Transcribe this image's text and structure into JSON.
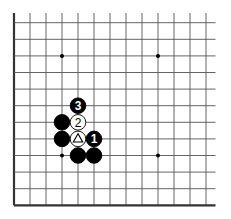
{
  "diagram": {
    "type": "go-board-fragment",
    "columns": 13,
    "rows": 12,
    "edges": {
      "left": true,
      "bottom": true,
      "top": false,
      "right": false
    },
    "hoshi": [
      [
        3,
        2
      ],
      [
        9,
        2
      ],
      [
        3,
        8
      ],
      [
        9,
        8
      ]
    ],
    "stones": [
      {
        "col": 4,
        "row": 5,
        "color": "black",
        "label": "3"
      },
      {
        "col": 3,
        "row": 6,
        "color": "black",
        "label": ""
      },
      {
        "col": 4,
        "row": 6,
        "color": "white",
        "label": "2"
      },
      {
        "col": 3,
        "row": 7,
        "color": "black",
        "label": ""
      },
      {
        "col": 4,
        "row": 7,
        "color": "white",
        "label": "",
        "marker": "triangle"
      },
      {
        "col": 5,
        "row": 7,
        "color": "black",
        "label": "1"
      },
      {
        "col": 4,
        "row": 8,
        "color": "black",
        "label": ""
      },
      {
        "col": 5,
        "row": 8,
        "color": "black",
        "label": ""
      }
    ],
    "colors": {
      "line": "#555555",
      "edge": "#333333",
      "black_stone": "#000000",
      "white_stone": "#ffffff",
      "background": "#ffffff"
    }
  }
}
